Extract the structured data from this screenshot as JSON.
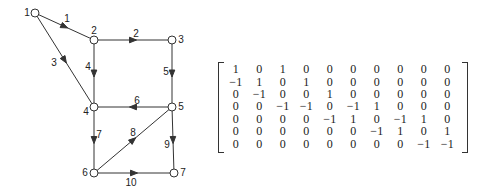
{
  "graph": {
    "nodes": [
      {
        "id": "1",
        "x": 35,
        "y": 13,
        "lx": -8,
        "ly": 0
      },
      {
        "id": "2",
        "x": 94,
        "y": 40,
        "lx": 0,
        "ly": -9
      },
      {
        "id": "3",
        "x": 172,
        "y": 40,
        "lx": 9,
        "ly": 0
      },
      {
        "id": "4",
        "x": 94,
        "y": 107,
        "lx": -8,
        "ly": 5
      },
      {
        "id": "5",
        "x": 172,
        "y": 107,
        "lx": 9,
        "ly": 0
      },
      {
        "id": "6",
        "x": 94,
        "y": 173,
        "lx": -9,
        "ly": 0
      },
      {
        "id": "7",
        "x": 174,
        "y": 173,
        "lx": 9,
        "ly": 0
      }
    ],
    "edges": [
      {
        "id": "1",
        "from": "1",
        "to": "2",
        "lx": 67,
        "ly": 19
      },
      {
        "id": "2",
        "from": "2",
        "to": "3",
        "lx": 136,
        "ly": 34
      },
      {
        "id": "3",
        "from": "1",
        "to": "4",
        "lx": 54,
        "ly": 63
      },
      {
        "id": "4",
        "from": "2",
        "to": "4",
        "lx": 88,
        "ly": 67
      },
      {
        "id": "5",
        "from": "3",
        "to": "5",
        "lx": 166,
        "ly": 72
      },
      {
        "id": "6",
        "from": "5",
        "to": "4",
        "lx": 137,
        "ly": 101
      },
      {
        "id": "7",
        "from": "4",
        "to": "6",
        "lx": 99,
        "ly": 135
      },
      {
        "id": "8",
        "from": "6",
        "to": "5",
        "lx": 133,
        "ly": 133
      },
      {
        "id": "9",
        "from": "5",
        "to": "7",
        "lx": 167,
        "ly": 145
      },
      {
        "id": "10",
        "from": "6",
        "to": "7",
        "lx": 131,
        "ly": 183
      }
    ]
  },
  "matrix": [
    [
      "1",
      "0",
      "1",
      "0",
      "0",
      "0",
      "0",
      "0",
      "0",
      "0"
    ],
    [
      "−1",
      "1",
      "0",
      "1",
      "0",
      "0",
      "0",
      "0",
      "0",
      "0"
    ],
    [
      "0",
      "−1",
      "0",
      "0",
      "1",
      "0",
      "0",
      "0",
      "0",
      "0"
    ],
    [
      "0",
      "0",
      "−1",
      "−1",
      "0",
      "−1",
      "1",
      "0",
      "0",
      "0"
    ],
    [
      "0",
      "0",
      "0",
      "0",
      "−1",
      "1",
      "0",
      "−1",
      "1",
      "0"
    ],
    [
      "0",
      "0",
      "0",
      "0",
      "0",
      "0",
      "−1",
      "1",
      "0",
      "1"
    ],
    [
      "0",
      "0",
      "0",
      "0",
      "0",
      "0",
      "0",
      "0",
      "−1",
      "−1"
    ]
  ]
}
